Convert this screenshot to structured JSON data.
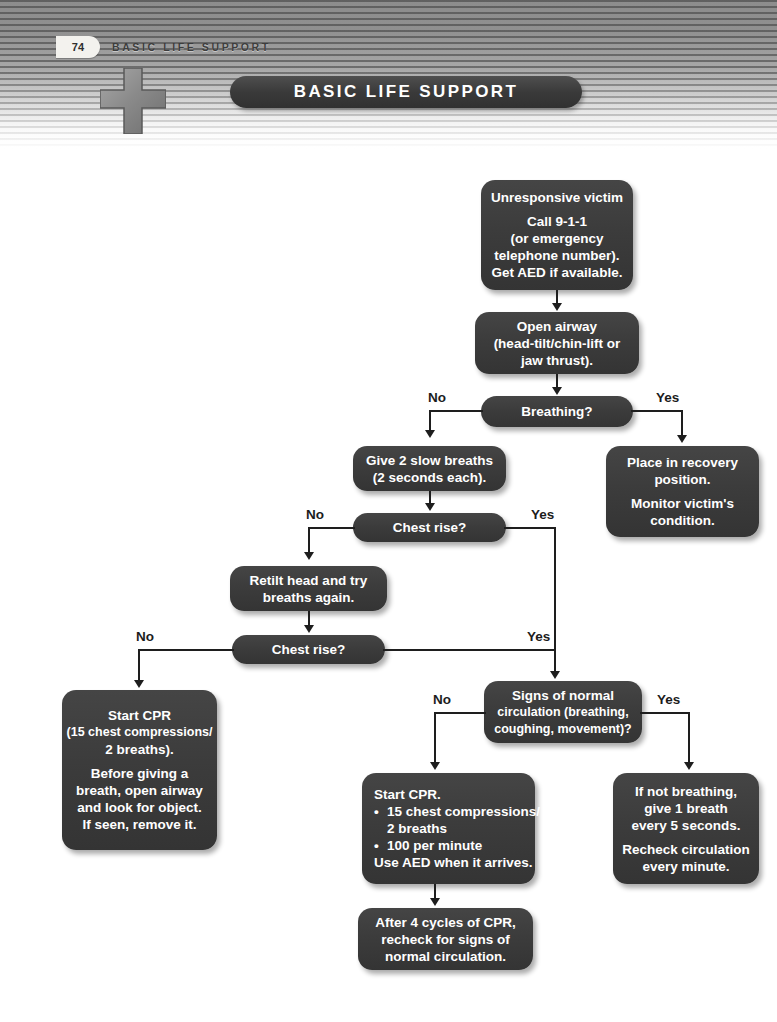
{
  "page": {
    "number": "74",
    "running_title": "BASIC LIFE SUPPORT",
    "banner_title": "BASIC LIFE SUPPORT",
    "cross_icon": "medical-cross-icon",
    "accent_dark": "#3a3a3a",
    "accent_line": "#1e1e1e",
    "background": "#ffffff"
  },
  "flowchart": {
    "type": "flowchart",
    "nodes": {
      "unresponsive": {
        "id": "unresponsive-victim",
        "lines": [
          "Unresponsive victim",
          "",
          "Call 9-1-1",
          "(or emergency",
          "telephone number).",
          "Get AED if available."
        ]
      },
      "open_airway": {
        "id": "open-airway",
        "lines": [
          "Open airway",
          "(head-tilt/chin-lift or",
          "jaw thrust)."
        ]
      },
      "breathing": {
        "id": "breathing-decision",
        "lines": [
          "Breathing?"
        ]
      },
      "recovery": {
        "id": "place-in-recovery-position",
        "lines": [
          "Place in recovery",
          "position.",
          "",
          "Monitor victim's",
          "condition."
        ]
      },
      "two_breaths": {
        "id": "give-2-slow-breaths",
        "lines": [
          "Give 2 slow breaths",
          "(2 seconds each)."
        ]
      },
      "chest_rise_1": {
        "id": "chest-rise-decision-1",
        "lines": [
          "Chest rise?"
        ]
      },
      "retilt": {
        "id": "retilt-head",
        "lines": [
          "Retilt head and try",
          "breaths again."
        ]
      },
      "chest_rise_2": {
        "id": "chest-rise-decision-2",
        "lines": [
          "Chest rise?"
        ]
      },
      "start_cpr_obstructed": {
        "id": "start-cpr-obstructed-airway",
        "lines": [
          "Start CPR",
          "(15 chest compressions/",
          "2 breaths).",
          "",
          "Before giving a",
          "breath, open airway",
          "and look for object.",
          "If seen, remove it."
        ]
      },
      "signs_circulation": {
        "id": "signs-of-normal-circulation-decision",
        "lines": [
          "Signs of normal",
          "circulation (breathing,",
          "coughing, movement)?"
        ]
      },
      "start_cpr": {
        "id": "start-cpr",
        "title": "Start CPR.",
        "bullets": [
          {
            "text": "15 chest compressions/",
            "cont": "2 breaths"
          },
          {
            "text": "100 per minute",
            "cont": ""
          }
        ],
        "footer": "Use AED when it arrives."
      },
      "after_4_cycles": {
        "id": "after-4-cycles",
        "lines": [
          "After 4 cycles of CPR,",
          "recheck for signs of",
          "normal circulation."
        ]
      },
      "if_not_breathing": {
        "id": "if-not-breathing",
        "lines": [
          "If not breathing,",
          "give 1 breath",
          "every 5 seconds.",
          "",
          "Recheck circulation",
          "every minute."
        ]
      }
    },
    "edge_labels": {
      "breathing_no": "No",
      "breathing_yes": "Yes",
      "chest_rise_1_no": "No",
      "chest_rise_1_yes": "Yes",
      "chest_rise_2_no": "No",
      "chest_rise_2_yes": "Yes",
      "circulation_no": "No",
      "circulation_yes": "Yes"
    }
  }
}
